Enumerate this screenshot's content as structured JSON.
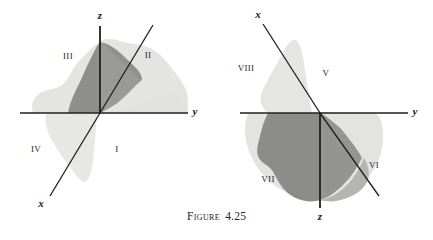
{
  "figure": {
    "caption_word": "Figure",
    "caption_number": "4.25",
    "colors": {
      "background": "#ffffff",
      "axis_line": "#1a1a1a",
      "blob_light": "#e2e2e0",
      "blob_mid": "#d2d2cf",
      "blob_dark": "#8d8d8a",
      "label_text": "#2b2b2b"
    }
  },
  "left_diagram": {
    "name": "octants-one-through-four",
    "origin": {
      "x": 100,
      "y": 113
    },
    "axes": [
      {
        "id": "z",
        "label": "z",
        "label_x": 100,
        "label_y": 19,
        "x1": 100,
        "y1": 26,
        "x2": 100,
        "y2": 113
      },
      {
        "id": "y",
        "label": "y",
        "label_x": 194,
        "label_y": 114,
        "x1": 100,
        "y1": 113,
        "x2": 188,
        "y2": 113
      },
      {
        "id": "y-neg",
        "label": "",
        "label_x": 0,
        "label_y": 0,
        "x1": 100,
        "y1": 113,
        "x2": 20,
        "y2": 113
      },
      {
        "id": "x",
        "label": "x",
        "label_x": 41,
        "label_y": 207,
        "x1": 100,
        "y1": 113,
        "x2": 50,
        "y2": 196
      },
      {
        "id": "x-neg",
        "label": "",
        "label_x": 0,
        "label_y": 0,
        "x1": 100,
        "y1": 113,
        "x2": 153,
        "y2": 25
      }
    ],
    "octants": [
      {
        "numeral": "I",
        "x": 117,
        "y": 152
      },
      {
        "numeral": "II",
        "x": 148,
        "y": 58
      },
      {
        "numeral": "III",
        "x": 68,
        "y": 59
      },
      {
        "numeral": "IV",
        "x": 36,
        "y": 152
      }
    ]
  },
  "right_diagram": {
    "name": "octants-five-through-eight",
    "origin": {
      "x": 320,
      "y": 113
    },
    "axes": [
      {
        "id": "x",
        "label": "x",
        "label_x": 258,
        "label_y": 18,
        "x1": 320,
        "y1": 113,
        "x2": 263,
        "y2": 24
      },
      {
        "id": "y",
        "label": "y",
        "label_x": 414,
        "label_y": 114,
        "x1": 320,
        "y1": 113,
        "x2": 408,
        "y2": 113
      },
      {
        "id": "y-neg",
        "label": "",
        "label_x": 0,
        "label_y": 0,
        "x1": 320,
        "y1": 113,
        "x2": 240,
        "y2": 113
      },
      {
        "id": "z",
        "label": "z",
        "label_x": 320,
        "label_y": 219,
        "x1": 320,
        "y1": 113,
        "x2": 320,
        "y2": 208
      },
      {
        "id": "x-neg",
        "label": "",
        "label_x": 0,
        "label_y": 0,
        "x1": 320,
        "y1": 113,
        "x2": 379,
        "y2": 196
      }
    ],
    "octants": [
      {
        "numeral": "V",
        "x": 326,
        "y": 76
      },
      {
        "numeral": "VI",
        "x": 374,
        "y": 168
      },
      {
        "numeral": "VII",
        "x": 268,
        "y": 182
      },
      {
        "numeral": "VIII",
        "x": 246,
        "y": 71
      }
    ]
  }
}
